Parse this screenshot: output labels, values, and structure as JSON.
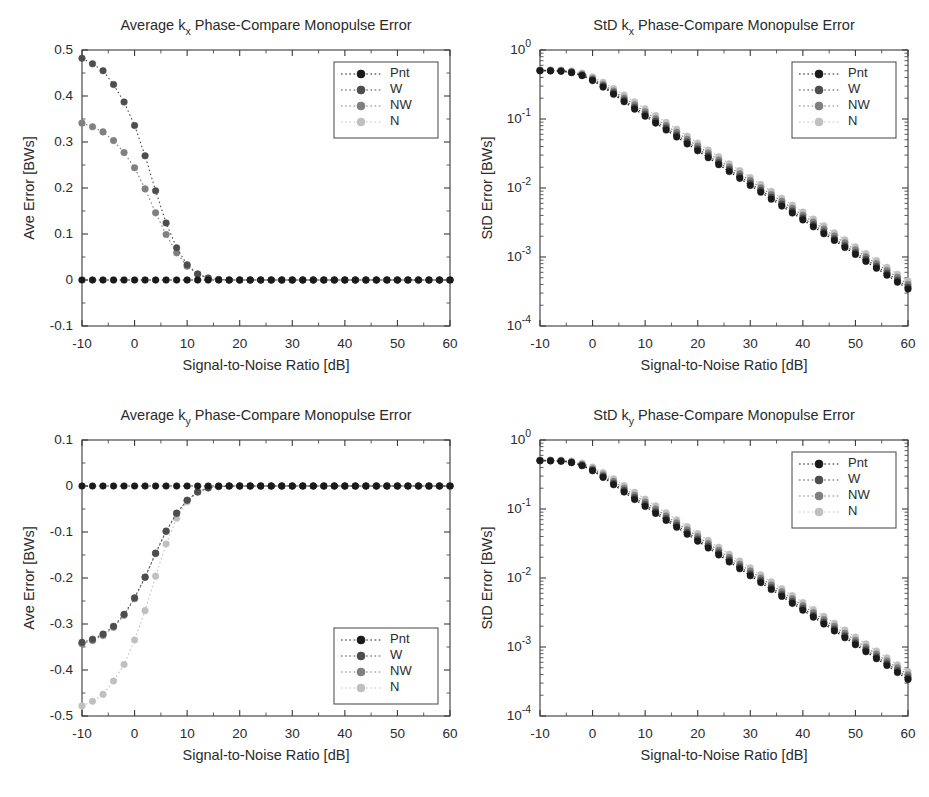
{
  "figure": {
    "width": 929,
    "height": 797,
    "background": "#ffffff"
  },
  "series_styles": [
    {
      "name": "Pnt",
      "color": "#1a1a1a"
    },
    {
      "name": "W",
      "color": "#4d4d4d"
    },
    {
      "name": "NW",
      "color": "#808080"
    },
    {
      "name": "N",
      "color": "#c0c0c0"
    }
  ],
  "legend": {
    "labels": [
      "Pnt",
      "W",
      "NW",
      "N"
    ]
  },
  "axis_labels": {
    "x": "Signal-to-Noise Ratio [dB]",
    "y_ave": "Ave Error [BWs]",
    "y_std": "StD Error [BWs]"
  },
  "chart_data": [
    {
      "id": "ave-kx",
      "type": "line",
      "title": "Average k_x Phase-Compare Monopulse Error",
      "title_prefix": "Average k",
      "title_sub": "x",
      "title_suffix": " Phase-Compare Monopulse Error",
      "xlabel": "Signal-to-Noise Ratio [dB]",
      "ylabel": "Ave Error [BWs]",
      "xscale": "linear",
      "yscale": "linear",
      "xlim": [
        -10,
        60
      ],
      "ylim": [
        -0.1,
        0.5
      ],
      "xticks": [
        -10,
        0,
        10,
        20,
        30,
        40,
        50,
        60
      ],
      "yticks": [
        -0.1,
        0,
        0.1,
        0.2,
        0.3,
        0.4,
        0.5
      ],
      "yticklabels": [
        "-0.1",
        "0",
        "0.1",
        "0.2",
        "0.3",
        "0.4",
        "0.5"
      ],
      "grid": false,
      "legend_position": "upper-right",
      "x": [
        -10,
        -8,
        -6,
        -4,
        -2,
        0,
        2,
        4,
        6,
        8,
        10,
        12,
        14,
        16,
        18,
        20,
        22,
        24,
        26,
        28,
        30,
        32,
        34,
        36,
        38,
        40,
        42,
        44,
        46,
        48,
        50,
        52,
        54,
        56,
        58,
        60
      ],
      "series": [
        {
          "name": "Pnt",
          "color": "#1a1a1a",
          "values": [
            0,
            0,
            0,
            0,
            0,
            0,
            0,
            0,
            0,
            0,
            0,
            0,
            0,
            0,
            0,
            0,
            0,
            0,
            0,
            0,
            0,
            0,
            0,
            0,
            0,
            0,
            0,
            0,
            0,
            0,
            0,
            0,
            0,
            0,
            0,
            0
          ]
        },
        {
          "name": "W",
          "color": "#4d4d4d",
          "values": [
            0.482,
            0.47,
            0.455,
            0.425,
            0.387,
            0.336,
            0.27,
            0.194,
            0.124,
            0.07,
            0.033,
            0.013,
            0.004,
            0.001,
            0,
            0,
            0,
            0,
            0,
            0,
            0,
            0,
            0,
            0,
            0,
            0,
            0,
            0,
            0,
            0,
            0,
            0,
            0,
            0,
            0,
            0
          ]
        },
        {
          "name": "NW",
          "color": "#808080",
          "values": [
            0.341,
            0.333,
            0.322,
            0.303,
            0.277,
            0.244,
            0.198,
            0.146,
            0.099,
            0.059,
            0.03,
            0.013,
            0.004,
            0.001,
            0,
            0,
            0,
            0,
            0,
            0,
            0,
            0,
            0,
            0,
            0,
            0,
            0,
            0,
            0,
            0,
            0,
            0,
            0,
            0,
            0,
            0
          ]
        },
        {
          "name": "N",
          "color": "#c0c0c0",
          "values": [
            0,
            0,
            0,
            0,
            0,
            0,
            0,
            0,
            0,
            0,
            0,
            0,
            0,
            0,
            0,
            0,
            0,
            0,
            0,
            0,
            0,
            0,
            0,
            0,
            0,
            0,
            0,
            0,
            0,
            0,
            0,
            0,
            0,
            0,
            0,
            0
          ]
        }
      ]
    },
    {
      "id": "std-kx",
      "type": "line",
      "title": "StD k_x Phase-Compare Monopulse Error",
      "title_prefix": "StD k",
      "title_sub": "x",
      "title_suffix": " Phase-Compare Monopulse Error",
      "xlabel": "Signal-to-Noise Ratio [dB]",
      "ylabel": "StD Error [BWs]",
      "xscale": "linear",
      "yscale": "log",
      "xlim": [
        -10,
        60
      ],
      "ylim": [
        0.0001,
        1
      ],
      "xticks": [
        -10,
        0,
        10,
        20,
        30,
        40,
        50,
        60
      ],
      "yticks": [
        0.0001,
        0.001,
        0.01,
        0.1,
        1
      ],
      "yticklabels": [
        "10^-4",
        "10^-3",
        "10^-2",
        "10^-1",
        "10^0"
      ],
      "grid": false,
      "legend_position": "upper-right",
      "x": [
        -10,
        -8,
        -6,
        -4,
        -2,
        0,
        2,
        4,
        6,
        8,
        10,
        12,
        14,
        16,
        18,
        20,
        22,
        24,
        26,
        28,
        30,
        32,
        34,
        36,
        38,
        40,
        42,
        44,
        46,
        48,
        50,
        52,
        54,
        56,
        58,
        60
      ],
      "series": [
        {
          "name": "Pnt",
          "color": "#1a1a1a",
          "values": [
            0.5,
            0.498,
            0.492,
            0.47,
            0.425,
            0.36,
            0.29,
            0.228,
            0.178,
            0.139,
            0.11,
            0.0872,
            0.0692,
            0.0549,
            0.0436,
            0.0346,
            0.0275,
            0.0218,
            0.0173,
            0.0138,
            0.0109,
            0.00868,
            0.00689,
            0.00547,
            0.00434,
            0.00345,
            0.00274,
            0.00217,
            0.00173,
            0.00137,
            0.00109,
            0.000864,
            0.000686,
            0.000545,
            0.000432,
            0.000343
          ]
        },
        {
          "name": "W",
          "color": "#4d4d4d",
          "values": [
            0.503,
            0.501,
            0.496,
            0.476,
            0.433,
            0.37,
            0.301,
            0.239,
            0.188,
            0.148,
            0.117,
            0.0931,
            0.0739,
            0.0587,
            0.0466,
            0.037,
            0.0294,
            0.0233,
            0.0185,
            0.0147,
            0.0117,
            0.00928,
            0.00737,
            0.00585,
            0.00464,
            0.00369,
            0.00293,
            0.00232,
            0.00184,
            0.00146,
            0.00116,
            0.000923,
            0.000733,
            0.000582,
            0.000462,
            0.000367
          ]
        },
        {
          "name": "NW",
          "color": "#808080",
          "values": [
            0.508,
            0.506,
            0.502,
            0.484,
            0.445,
            0.385,
            0.317,
            0.254,
            0.202,
            0.16,
            0.127,
            0.101,
            0.0805,
            0.064,
            0.0508,
            0.0404,
            0.0321,
            0.0255,
            0.0202,
            0.0161,
            0.0128,
            0.0101,
            0.00805,
            0.00639,
            0.00508,
            0.00403,
            0.0032,
            0.00254,
            0.00202,
            0.0016,
            0.00127,
            0.00101,
            0.000802,
            0.000637,
            0.000506,
            0.000402
          ]
        },
        {
          "name": "N",
          "color": "#c0c0c0",
          "values": [
            0.515,
            0.514,
            0.512,
            0.498,
            0.464,
            0.408,
            0.341,
            0.277,
            0.222,
            0.177,
            0.141,
            0.112,
            0.0893,
            0.071,
            0.0564,
            0.0448,
            0.0356,
            0.0283,
            0.0225,
            0.0179,
            0.0142,
            0.0113,
            0.00894,
            0.0071,
            0.00564,
            0.00448,
            0.00356,
            0.00283,
            0.00224,
            0.00178,
            0.00141,
            0.00112,
            0.000891,
            0.000708,
            0.000562,
            0.000447
          ]
        }
      ]
    },
    {
      "id": "ave-ky",
      "type": "line",
      "title": "Average k_y Phase-Compare Monopulse Error",
      "title_prefix": "Average k",
      "title_sub": "y",
      "title_suffix": " Phase-Compare Monopulse Error",
      "xlabel": "Signal-to-Noise Ratio [dB]",
      "ylabel": "Ave Error [BWs]",
      "xscale": "linear",
      "yscale": "linear",
      "xlim": [
        -10,
        60
      ],
      "ylim": [
        -0.5,
        0.1
      ],
      "xticks": [
        -10,
        0,
        10,
        20,
        30,
        40,
        50,
        60
      ],
      "yticks": [
        -0.5,
        -0.4,
        -0.3,
        -0.2,
        -0.1,
        0,
        0.1
      ],
      "yticklabels": [
        "-0.5",
        "-0.4",
        "-0.3",
        "-0.2",
        "-0.1",
        "0",
        "0.1"
      ],
      "grid": false,
      "legend_position": "lower-right",
      "x": [
        -10,
        -8,
        -6,
        -4,
        -2,
        0,
        2,
        4,
        6,
        8,
        10,
        12,
        14,
        16,
        18,
        20,
        22,
        24,
        26,
        28,
        30,
        32,
        34,
        36,
        38,
        40,
        42,
        44,
        46,
        48,
        50,
        52,
        54,
        56,
        58,
        60
      ],
      "series": [
        {
          "name": "Pnt",
          "color": "#1a1a1a",
          "values": [
            0,
            0,
            0,
            0,
            0,
            0,
            0,
            0,
            0,
            0,
            0,
            0,
            0,
            0,
            0,
            0,
            0,
            0,
            0,
            0,
            0,
            0,
            0,
            0,
            0,
            0,
            0,
            0,
            0,
            0,
            0,
            0,
            0,
            0,
            0,
            0
          ]
        },
        {
          "name": "W",
          "color": "#4d4d4d",
          "values": [
            -0.34,
            -0.333,
            -0.322,
            -0.305,
            -0.279,
            -0.243,
            -0.198,
            -0.146,
            -0.098,
            -0.059,
            -0.031,
            -0.013,
            -0.004,
            -0.001,
            0,
            0,
            0,
            0,
            0,
            0,
            0,
            0,
            0,
            0,
            0,
            0,
            0,
            0,
            0,
            0,
            0,
            0,
            0,
            0,
            0,
            0
          ]
        },
        {
          "name": "NW",
          "color": "#808080",
          "values": [
            -0.343,
            -0.336,
            -0.325,
            -0.307,
            -0.281,
            -0.245,
            -0.199,
            -0.147,
            -0.099,
            -0.06,
            -0.031,
            -0.013,
            -0.004,
            -0.001,
            0,
            0,
            0,
            0,
            0,
            0,
            0,
            0,
            0,
            0,
            0,
            0,
            0,
            0,
            0,
            0,
            0,
            0,
            0,
            0,
            0,
            0
          ]
        },
        {
          "name": "N",
          "color": "#c0c0c0",
          "values": [
            -0.478,
            -0.468,
            -0.453,
            -0.424,
            -0.388,
            -0.335,
            -0.271,
            -0.196,
            -0.126,
            -0.07,
            -0.034,
            -0.013,
            -0.004,
            -0.001,
            0,
            0,
            0,
            0,
            0,
            0,
            0,
            0,
            0,
            0,
            0,
            0,
            0,
            0,
            0,
            0,
            0,
            0,
            0,
            0,
            0,
            0
          ]
        }
      ]
    },
    {
      "id": "std-ky",
      "type": "line",
      "title": "StD k_y Phase-Compare Monopulse Error",
      "title_prefix": "StD k",
      "title_sub": "y",
      "title_suffix": " Phase-Compare Monopulse Error",
      "xlabel": "Signal-to-Noise Ratio [dB]",
      "ylabel": "StD Error [BWs]",
      "xscale": "linear",
      "yscale": "log",
      "xlim": [
        -10,
        60
      ],
      "ylim": [
        0.0001,
        1
      ],
      "xticks": [
        -10,
        0,
        10,
        20,
        30,
        40,
        50,
        60
      ],
      "yticks": [
        0.0001,
        0.001,
        0.01,
        0.1,
        1
      ],
      "yticklabels": [
        "10^-4",
        "10^-3",
        "10^-2",
        "10^-1",
        "10^0"
      ],
      "grid": false,
      "legend_position": "upper-right",
      "x": [
        -10,
        -8,
        -6,
        -4,
        -2,
        0,
        2,
        4,
        6,
        8,
        10,
        12,
        14,
        16,
        18,
        20,
        22,
        24,
        26,
        28,
        30,
        32,
        34,
        36,
        38,
        40,
        42,
        44,
        46,
        48,
        50,
        52,
        54,
        56,
        58,
        60
      ],
      "series": [
        {
          "name": "Pnt",
          "color": "#1a1a1a",
          "values": [
            0.5,
            0.498,
            0.492,
            0.47,
            0.424,
            0.358,
            0.287,
            0.225,
            0.176,
            0.137,
            0.109,
            0.0862,
            0.0684,
            0.0543,
            0.0431,
            0.0342,
            0.0272,
            0.0216,
            0.0171,
            0.0136,
            0.0108,
            0.00858,
            0.00681,
            0.00541,
            0.00429,
            0.00341,
            0.00271,
            0.00215,
            0.00171,
            0.00136,
            0.00108,
            0.000854,
            0.000678,
            0.000539,
            0.000427,
            0.000339
          ]
        },
        {
          "name": "W",
          "color": "#4d4d4d",
          "values": [
            0.503,
            0.501,
            0.496,
            0.475,
            0.431,
            0.367,
            0.298,
            0.236,
            0.186,
            0.146,
            0.116,
            0.0919,
            0.073,
            0.058,
            0.046,
            0.0365,
            0.029,
            0.0231,
            0.0183,
            0.0145,
            0.0115,
            0.00916,
            0.00727,
            0.00577,
            0.00458,
            0.00364,
            0.00289,
            0.00229,
            0.00182,
            0.00145,
            0.00115,
            0.000911,
            0.000723,
            0.000574,
            0.000456,
            0.000362
          ]
        },
        {
          "name": "NW",
          "color": "#808080",
          "values": [
            0.508,
            0.506,
            0.502,
            0.483,
            0.443,
            0.382,
            0.314,
            0.251,
            0.2,
            0.158,
            0.126,
            0.0998,
            0.0793,
            0.063,
            0.05,
            0.0398,
            0.0316,
            0.0251,
            0.0199,
            0.0158,
            0.0126,
            0.00998,
            0.00792,
            0.00629,
            0.005,
            0.00397,
            0.00315,
            0.0025,
            0.00199,
            0.00158,
            0.00125,
            0.000994,
            0.000789,
            0.000627,
            0.000498,
            0.000396
          ]
        },
        {
          "name": "N",
          "color": "#c0c0c0",
          "values": [
            0.514,
            0.513,
            0.511,
            0.497,
            0.462,
            0.405,
            0.338,
            0.274,
            0.219,
            0.175,
            0.139,
            0.111,
            0.088,
            0.0699,
            0.0556,
            0.0441,
            0.0351,
            0.0279,
            0.0221,
            0.0176,
            0.014,
            0.0111,
            0.00881,
            0.00699,
            0.00556,
            0.00441,
            0.0035,
            0.00278,
            0.00221,
            0.00176,
            0.00139,
            0.00111,
            0.000877,
            0.000697,
            0.000553,
            0.00044
          ]
        }
      ]
    }
  ],
  "panels": [
    {
      "id": "ave-kx",
      "x": 18,
      "y": 8,
      "w": 450,
      "h": 390
    },
    {
      "id": "std-kx",
      "x": 476,
      "y": 8,
      "w": 450,
      "h": 390
    },
    {
      "id": "ave-ky",
      "x": 18,
      "y": 398,
      "w": 450,
      "h": 390
    },
    {
      "id": "std-ky",
      "x": 476,
      "y": 398,
      "w": 450,
      "h": 390
    }
  ]
}
